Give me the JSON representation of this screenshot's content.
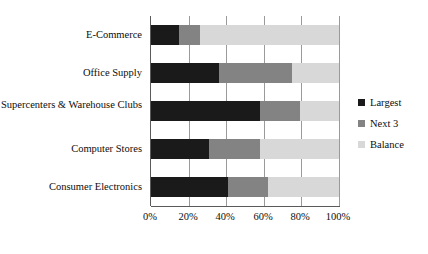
{
  "chart_data": {
    "type": "bar",
    "orientation": "horizontal",
    "stacked": true,
    "stacked_mode": "100-percent",
    "title": "",
    "xlabel": "",
    "ylabel": "",
    "xlim": [
      0,
      100
    ],
    "grid": true,
    "legend_position": "right",
    "categories": [
      "E-Commerce",
      "Office Supply",
      "Supercenters & Warehouse Clubs",
      "Computer Stores",
      "Consumer Electronics"
    ],
    "xticks": [
      0,
      20,
      40,
      60,
      80,
      100
    ],
    "xtick_labels": [
      "0%",
      "20%",
      "40%",
      "60%",
      "80%",
      "100%"
    ],
    "series": [
      {
        "name": "Largest",
        "color": "#1a1a1a",
        "values": [
          15,
          36,
          58,
          31,
          41
        ]
      },
      {
        "name": "Next 3",
        "color": "#838383",
        "values": [
          11,
          39,
          21,
          27,
          21
        ]
      },
      {
        "name": "Balance",
        "color": "#d8d8d8",
        "values": [
          74,
          25,
          21,
          42,
          38
        ]
      }
    ],
    "cumulative_boundaries": [
      [
        15,
        26
      ],
      [
        36,
        75
      ],
      [
        58,
        79
      ],
      [
        31,
        58
      ],
      [
        41,
        62
      ]
    ]
  },
  "legend": {
    "items": [
      {
        "label": "Largest",
        "color": "#1a1a1a"
      },
      {
        "label": "Next 3",
        "color": "#838383"
      },
      {
        "label": "Balance",
        "color": "#d8d8d8"
      }
    ]
  }
}
